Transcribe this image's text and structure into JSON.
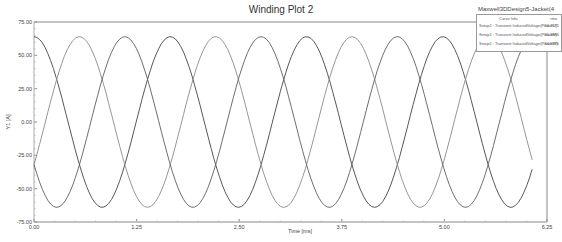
{
  "chart_data": {
    "type": "line",
    "title": "Winding Plot 2",
    "xlabel": "Time [ms]",
    "ylabel": "Y1 [A]",
    "xlim": [
      0.0,
      6.25
    ],
    "ylim": [
      -75.0,
      75.0
    ],
    "x_ticks": [
      "0.00",
      "1.25",
      "2.50",
      "3.75",
      "5.00",
      "6.25"
    ],
    "y_ticks": [
      "75.00",
      "50.00",
      "25.00",
      "0.00",
      "-25.00",
      "-50.00",
      "-75.00"
    ],
    "grid": false,
    "legend_position": "top-right",
    "legend": {
      "header": "Maxwell3DDesign5-Jacket(4",
      "columns": [
        "Curve Info",
        "rms"
      ],
      "entries": [
        {
          "name": "Setup1 : Transient InducedVoltage(PhaseU)",
          "rms": "44.7575"
        },
        {
          "name": "Setup1 : Transient InducedVoltage(PhaseV)",
          "rms": "45.3886"
        },
        {
          "name": "Setup1 : Transient InducedVoltage(PhaseW)",
          "rms": "44.9376"
        }
      ]
    },
    "series": [
      {
        "name": "InducedVoltage(PhaseU)",
        "amplitude": 64,
        "period_ms": 1.66,
        "phase_deg": 90,
        "color": "#444444"
      },
      {
        "name": "InducedVoltage(PhaseV)",
        "amplitude": 64,
        "period_ms": 1.66,
        "phase_deg": -30,
        "color": "#8a8a8a"
      },
      {
        "name": "InducedVoltage(PhaseW)",
        "amplitude": 64,
        "period_ms": 1.66,
        "phase_deg": 210,
        "color": "#5e5e5e"
      }
    ],
    "x_end_ms": 6.07
  }
}
